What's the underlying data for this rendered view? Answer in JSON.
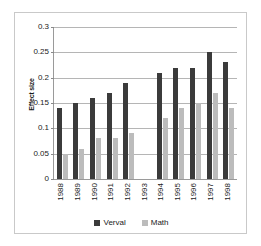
{
  "chart_data": {
    "type": "bar",
    "title": "",
    "xlabel": "",
    "ylabel": "Effect size",
    "ylim": [
      0,
      0.3
    ],
    "ytick_step": 0.05,
    "yticks": [
      "0.3",
      "0.25",
      "0.2",
      "0.15",
      "0.1",
      "0.05",
      "0"
    ],
    "ytick_values": [
      0.3,
      0.25,
      0.2,
      0.15,
      0.1,
      0.05,
      0
    ],
    "grid": true,
    "legend_position": "bottom",
    "categories": [
      "1988",
      "1989",
      "1990",
      "1991",
      "1992",
      "1993",
      "1994",
      "1995",
      "1996",
      "1997",
      "1998"
    ],
    "series": [
      {
        "name": "Verval",
        "color": "#3b3b3b",
        "values": [
          0.14,
          0.15,
          0.16,
          0.17,
          0.19,
          null,
          0.21,
          0.22,
          0.22,
          0.25,
          0.23
        ]
      },
      {
        "name": "Math",
        "color": "#bcbcbc",
        "values": [
          0.05,
          0.06,
          0.08,
          0.08,
          0.09,
          null,
          0.12,
          0.14,
          0.15,
          0.17,
          0.14
        ]
      }
    ]
  },
  "legend": {
    "entries": [
      {
        "label": "Verval",
        "color": "#3b3b3b"
      },
      {
        "label": "Math",
        "color": "#bcbcbc"
      }
    ]
  },
  "axis": {
    "y_title": "Effect size"
  }
}
